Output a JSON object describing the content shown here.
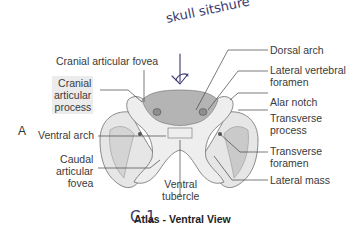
{
  "panel_letter": "A",
  "title": "Atlas - Ventral View",
  "handwriting": {
    "top_note": "skull sitshure",
    "bottom_note": "C-1"
  },
  "labels": {
    "cranial_articular_fovea": "Cranial articular fovea",
    "cranial_articular_process": [
      "Cranial",
      "articular",
      "process"
    ],
    "ventral_arch": "Ventral arch",
    "caudal_articular_fovea": [
      "Caudal",
      "articular",
      "fovea"
    ],
    "ventral_tubercle": [
      "Ventral",
      "tubercle"
    ],
    "dorsal_arch": "Dorsal arch",
    "lateral_vertebral_foramen": [
      "Lateral vertebral",
      "foramen"
    ],
    "alar_notch": "Alar notch",
    "transverse_process": [
      "Transverse",
      "process"
    ],
    "transverse_foramen": [
      "Transverse",
      "foramen"
    ],
    "lateral_mass": "Lateral mass"
  },
  "colors": {
    "bone_light": "#e9e9e9",
    "bone_mid": "#cfcfcf",
    "bone_dark": "#a9a9a9",
    "outline": "#6e6e6e",
    "leader": "#444444",
    "ink": "#3a3a70"
  }
}
